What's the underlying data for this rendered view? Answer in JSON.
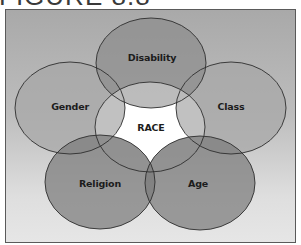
{
  "figure": {
    "title": "FIGURE 8.8"
  },
  "diagram": {
    "type": "venn",
    "center": {
      "label": "RACE",
      "fill": "#c9c9c9",
      "core_fill": "#ffffff",
      "cx": 150,
      "cy": 127,
      "rx": 55,
      "ry": 45
    },
    "sets": [
      {
        "id": "disability",
        "label": "Disability",
        "fill": "#8c8c8c",
        "cx": 151,
        "cy": 63,
        "rx": 55,
        "ry": 45,
        "label_x": 152,
        "label_y": 57
      },
      {
        "id": "gender",
        "label": "Gender",
        "fill": "#a6a6a6",
        "cx": 70,
        "cy": 108,
        "rx": 55,
        "ry": 46,
        "label_x": 70,
        "label_y": 106
      },
      {
        "id": "class",
        "label": "Class",
        "fill": "#a6a6a6",
        "cx": 231,
        "cy": 108,
        "rx": 55,
        "ry": 46,
        "label_x": 231,
        "label_y": 106
      },
      {
        "id": "religion",
        "label": "Religion",
        "fill": "#7b7b7b",
        "cx": 100,
        "cy": 182,
        "rx": 55,
        "ry": 47,
        "label_x": 100,
        "label_y": 183
      },
      {
        "id": "age",
        "label": "Age",
        "fill": "#7b7b7b",
        "cx": 200,
        "cy": 183,
        "rx": 55,
        "ry": 47,
        "label_x": 198,
        "label_y": 183
      }
    ],
    "stroke": "#2e2e2e"
  },
  "frame": {
    "border_color": "#5a5a5a",
    "gradient_top": "#a9a9a9",
    "gradient_bottom": "#e6e6e6"
  }
}
